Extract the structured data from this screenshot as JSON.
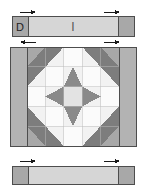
{
  "diagram": {
    "name": "quilt-block-assembly-diagram",
    "width": 146,
    "height": 191,
    "background": "#ffffff"
  },
  "colors": {
    "background": "#ffffff",
    "light": "#f2f2f2",
    "medium_light": "#d6d6d6",
    "medium": "#b3b3b3",
    "medium_gray": "#a8a8a8",
    "dark": "#7d7d7d",
    "outline": "#4d4d4d",
    "arrow": "#1a1a1a",
    "label_text": "#222222"
  },
  "labels": {
    "strip_left_label": "D",
    "strip_center_label": "I"
  },
  "top_strip": {
    "name": "top-sashing-strip",
    "x": 12,
    "y": 16,
    "width": 122,
    "height": 20,
    "end_square_left": {
      "x": 12,
      "y": 16,
      "width": 16,
      "height": 20,
      "fill": "#a8a8a8"
    },
    "end_square_right": {
      "x": 118,
      "y": 16,
      "width": 16,
      "height": 20,
      "fill": "#a8a8a8"
    },
    "body": {
      "x": 28,
      "y": 16,
      "width": 90,
      "height": 20,
      "fill": "#d6d6d6"
    },
    "center_tick": {
      "x": 73,
      "y": 20,
      "height": 12
    }
  },
  "bottom_strip": {
    "name": "bottom-sashing-strip",
    "x": 12,
    "y": 166,
    "width": 122,
    "height": 18,
    "end_square_left": {
      "x": 12,
      "y": 166,
      "width": 16,
      "height": 18,
      "fill": "#a8a8a8"
    },
    "end_square_right": {
      "x": 118,
      "y": 166,
      "width": 16,
      "height": 18,
      "fill": "#a8a8a8"
    },
    "body": {
      "x": 28,
      "y": 166,
      "width": 90,
      "height": 18,
      "fill": "#d6d6d6"
    }
  },
  "main_block": {
    "name": "center-quilt-block",
    "x": 10,
    "y": 47,
    "width": 126,
    "height": 99,
    "left_sashing": {
      "x": 10,
      "y": 47,
      "width": 17,
      "height": 99,
      "fill": "#b3b3b3"
    },
    "right_sashing": {
      "x": 119,
      "y": 47,
      "width": 17,
      "height": 99,
      "fill": "#b3b3b3"
    },
    "grid": {
      "x": 27,
      "y": 47,
      "width": 92,
      "height": 99,
      "rows": 5,
      "cols": 5
    },
    "pattern": "square-in-a-square with half-square-triangle corners",
    "cells": [
      [
        "hst-tl-dark",
        "hst-dark-right",
        "plain-light",
        "hst-dark-left",
        "hst-tr-dark"
      ],
      [
        "hst-dark-down",
        "plain-light",
        "tri-up-dark",
        "plain-light",
        "hst-dark-down"
      ],
      [
        "plain-light",
        "tri-left-dark",
        "center-square",
        "tri-right-dark",
        "plain-light"
      ],
      [
        "hst-dark-up",
        "plain-light",
        "tri-down-dark",
        "plain-light",
        "hst-dark-up"
      ],
      [
        "hst-bl-dark",
        "hst-dark-right",
        "plain-light",
        "hst-dark-left",
        "hst-br-dark"
      ]
    ]
  },
  "arrows": [
    {
      "name": "arrow-top-left",
      "x": 20,
      "y": 11,
      "direction": "right"
    },
    {
      "name": "arrow-top-right",
      "x": 108,
      "y": 11,
      "direction": "right"
    },
    {
      "name": "arrow-block-left",
      "x": 20,
      "y": 42,
      "direction": "left"
    },
    {
      "name": "arrow-block-right",
      "x": 108,
      "y": 42,
      "direction": "right"
    },
    {
      "name": "arrow-bottom-left",
      "x": 20,
      "y": 161,
      "direction": "right"
    },
    {
      "name": "arrow-bottom-right",
      "x": 108,
      "y": 161,
      "direction": "right"
    }
  ]
}
